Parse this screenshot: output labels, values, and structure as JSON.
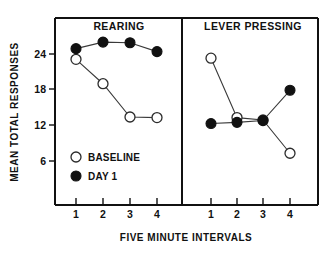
{
  "figure": {
    "ylabel": "MEAN TOTAL RESPONSES",
    "xlabel": "FIVE MINUTE INTERVALS",
    "legend": [
      {
        "marker": "open-circle-marker",
        "label": "BASELINE"
      },
      {
        "marker": "filled-circle-marker",
        "label": "DAY 1"
      }
    ],
    "colors": {
      "axis": "#111111",
      "line": "#3a3a3a",
      "baseline_marker_fill": "#ffffff",
      "day1_marker_fill": "#111111"
    },
    "y_ticks": [
      "6",
      "12",
      "18",
      "24"
    ],
    "x_ticks": [
      "1",
      "2",
      "3",
      "4"
    ]
  },
  "chart_data": [
    {
      "type": "line",
      "title": "REARING",
      "xlabel": "FIVE MINUTE INTERVALS",
      "ylabel": "MEAN TOTAL RESPONSES",
      "x": [
        1,
        2,
        3,
        4
      ],
      "categories": [
        "1",
        "2",
        "3",
        "4"
      ],
      "ylim": [
        2,
        28
      ],
      "yticks": [
        6,
        12,
        18,
        24
      ],
      "grid": false,
      "legend_position": "inside-lower-left",
      "series": [
        {
          "name": "BASELINE",
          "marker": "open-circle",
          "values": [
            23.1,
            19.0,
            13.4,
            13.3
          ]
        },
        {
          "name": "DAY 1",
          "marker": "filled-circle",
          "values": [
            24.9,
            26.0,
            25.9,
            24.4
          ]
        }
      ]
    },
    {
      "type": "line",
      "title": "LEVER PRESSING",
      "xlabel": "FIVE MINUTE INTERVALS",
      "ylabel": "MEAN TOTAL RESPONSES",
      "x": [
        1,
        2,
        3,
        4
      ],
      "categories": [
        "1",
        "2",
        "3",
        "4"
      ],
      "ylim": [
        2,
        28
      ],
      "yticks": [
        6,
        12,
        18,
        24
      ],
      "grid": false,
      "legend_position": "none",
      "series": [
        {
          "name": "BASELINE",
          "marker": "open-circle",
          "values": [
            23.3,
            13.3,
            12.9,
            7.3
          ]
        },
        {
          "name": "DAY 1",
          "marker": "filled-circle",
          "values": [
            12.3,
            12.5,
            12.8,
            17.9
          ]
        }
      ]
    }
  ]
}
